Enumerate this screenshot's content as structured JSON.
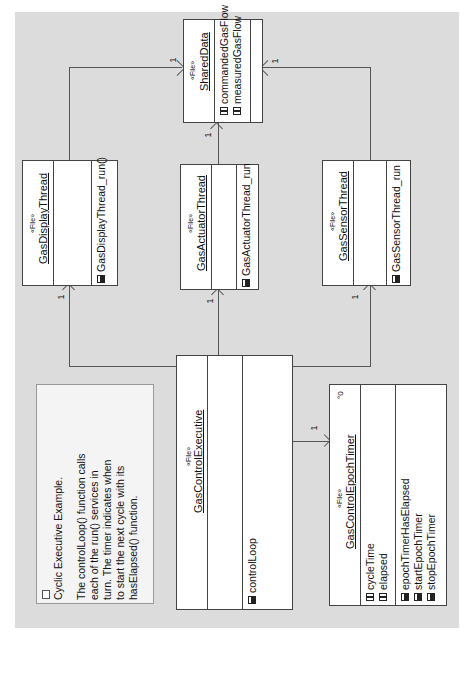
{
  "diagram": {
    "type": "UML class diagram (rotated 90° counter-clockwise)",
    "stereotype": "«File»",
    "classes": {
      "shared_data": {
        "name": "SharedData",
        "attributes": [
          "commandedGasFlow",
          "measuredGasFlow"
        ],
        "operations": []
      },
      "display_thread": {
        "name": "GasDisplayThread",
        "attributes": [],
        "operations": [
          "GasDisplayThread_run()"
        ]
      },
      "actuator_thread": {
        "name": "GasActuatorThread",
        "attributes": [],
        "operations": [
          "GasActuatorThread_run"
        ]
      },
      "sensor_thread": {
        "name": "GasSensorThread",
        "attributes": [],
        "operations": [
          "GasSensorThread_run"
        ]
      },
      "control_executive": {
        "name": "GasControlExecutive",
        "attributes": [],
        "operations": [
          "controlLoop"
        ]
      },
      "epoch_timer": {
        "name": "GasControlEpochTimer",
        "attributes": [
          "cycleTime",
          "elapsed"
        ],
        "operations": [
          "epochTimerHasElapsed",
          "startEpochTimer",
          "stopEpochTimer"
        ]
      }
    },
    "associations": [
      {
        "from": "GasDisplayThread",
        "to": "SharedData",
        "multiplicity": "1"
      },
      {
        "from": "GasActuatorThread",
        "to": "SharedData",
        "multiplicity": "1"
      },
      {
        "from": "GasSensorThread",
        "to": "SharedData",
        "multiplicity": "1"
      },
      {
        "from": "GasControlExecutive",
        "to": "GasDisplayThread",
        "multiplicity": "1"
      },
      {
        "from": "GasControlExecutive",
        "to": "GasActuatorThread",
        "multiplicity": "1"
      },
      {
        "from": "GasControlExecutive",
        "to": "GasSensorThread",
        "multiplicity": "1"
      },
      {
        "from": "GasControlExecutive",
        "to": "GasControlEpochTimer",
        "multiplicity": "1"
      }
    ],
    "note": {
      "title": "Cyclic Executive Example.",
      "lines": [
        "The controlLoop() function calls",
        "each of the run() services in",
        "turn. The timer indicates when",
        "to start the next cycle with its",
        "hasElapsed() function."
      ]
    }
  }
}
